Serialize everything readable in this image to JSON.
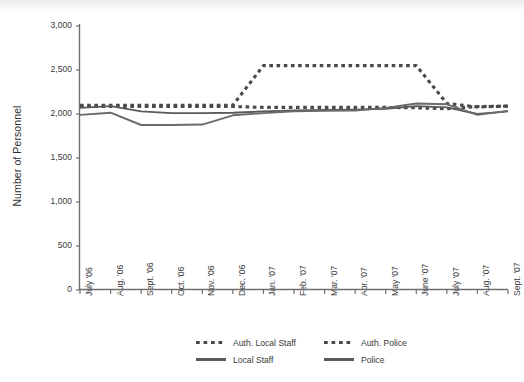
{
  "chart_data": {
    "type": "line",
    "title": "",
    "xlabel": "",
    "ylabel": "Number of Personnel",
    "ylim": [
      0,
      3000
    ],
    "yticks": [
      0,
      500,
      1000,
      1500,
      2000,
      2500,
      3000
    ],
    "ytick_labels": [
      "0",
      "500",
      "1,000",
      "1,500",
      "2,000",
      "2,500",
      "3,000"
    ],
    "grid": false,
    "legend_position": "bottom",
    "categories": [
      "July '06",
      "Aug. '06",
      "Sept. '06",
      "Oct. '06",
      "Nov. '06",
      "Dec. '06",
      "Jan. '07",
      "Feb. '07",
      "Mar. '07",
      "Apr. '07",
      "May '07",
      "June '07",
      "July '07",
      "Aug. '07",
      "Sept. '07"
    ],
    "series": [
      {
        "name": "Auth. Local Staff",
        "style": "dashed",
        "color": "#4a4a4a",
        "values": [
          2100,
          2100,
          2100,
          2100,
          2100,
          2100,
          2550,
          2550,
          2550,
          2550,
          2550,
          2550,
          2120,
          2080,
          2090
        ]
      },
      {
        "name": "Auth. Police",
        "style": "dashed",
        "color": "#4a4a4a",
        "values": [
          2085,
          2085,
          2085,
          2085,
          2085,
          2085,
          2075,
          2075,
          2075,
          2075,
          2075,
          2070,
          2060,
          2085,
          2090
        ]
      },
      {
        "name": "Local Staff",
        "style": "solid",
        "color": "#5a5a5a",
        "values": [
          2070,
          2090,
          2030,
          2010,
          2010,
          2015,
          2030,
          2040,
          2045,
          2050,
          2060,
          2090,
          2075,
          2000,
          2030
        ]
      },
      {
        "name": "Police",
        "style": "solid",
        "color": "#6a6a6a",
        "values": [
          1990,
          2015,
          1875,
          1875,
          1880,
          1985,
          2010,
          2030,
          2035,
          2040,
          2070,
          2120,
          2110,
          1990,
          2035
        ]
      }
    ]
  },
  "legend": {
    "entries": [
      {
        "label": "Auth. Local Staff",
        "style": "dashed"
      },
      {
        "label": "Auth. Police",
        "style": "dashed"
      },
      {
        "label": "Local Staff",
        "style": "solid"
      },
      {
        "label": "Police",
        "style": "solid"
      }
    ]
  }
}
